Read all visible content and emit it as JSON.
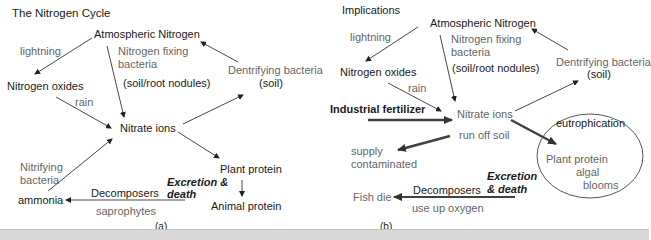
{
  "panel_a": {
    "title": "The Nitrogen Cycle",
    "caption": "(a)",
    "nodes": {
      "atmospheric_nitrogen": "Atmospheric Nitrogen",
      "nitrogen_oxides": "Nitrogen oxides",
      "nitrate_ions": "Nitrate ions",
      "plant_protein": "Plant protein",
      "animal_protein": "Animal protein",
      "ammonia": "ammonia",
      "dentrifying_bacteria": "Dentrifying bacteria",
      "dentrifying_soil": "(soil)"
    },
    "edge_labels": {
      "lightning": "lightning",
      "nitrogen_fixing_1": "Nitrogen fixing",
      "nitrogen_fixing_2": "bacteria",
      "soil_root": "(soil/root nodules)",
      "rain": "rain",
      "nitrifying_1": "Nitrifying",
      "nitrifying_2": "bacteria",
      "excretion_1": "Excretion &",
      "excretion_2": "death",
      "decomposers": "Decomposers",
      "saprophytes": "saprophytes"
    }
  },
  "panel_b": {
    "title": "Implications",
    "caption": "(b)",
    "nodes": {
      "atmospheric_nitrogen": "Atmospheric Nitrogen",
      "nitrogen_oxides": "Nitrogen oxides",
      "nitrate_ions": "Nitrate ions",
      "industrial_fertilizer": "Industrial fertilizer",
      "supply_1": "supply",
      "supply_2": "contaminated",
      "eutrophication": "eutrophication",
      "plant_protein": "Plant protein",
      "algal_1": "algal",
      "algal_2": "blooms",
      "fish_die": "Fish die",
      "dentrifying_bacteria": "Dentrifying bacteria",
      "dentrifying_soil": "(soil)"
    },
    "edge_labels": {
      "lightning": "lightning",
      "nitrogen_fixing_1": "Nitrogen fixing",
      "nitrogen_fixing_2": "bacteria",
      "soil_root": "(soil/root nodules)",
      "rain": "rain",
      "run_off": "run off soil",
      "excretion_1": "Excretion",
      "excretion_2": "& death",
      "decomposers": "Decomposers",
      "use_up_oxygen": "use up oxygen"
    }
  },
  "colors": {
    "dark_text": "#1a1a1a",
    "gray_text": "#666666",
    "arrow": "#333333",
    "bold_arrow": "#404040"
  }
}
